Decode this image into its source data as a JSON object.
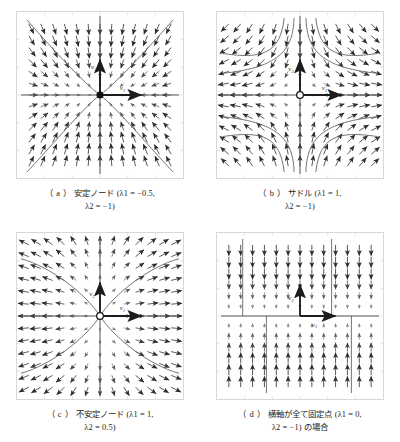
{
  "figure": {
    "background": "#ffffff",
    "frame_color": "#d8d8d8",
    "arrow_color": "#2b2b2b",
    "trajectory_color": "#4a4a4a",
    "axis_color": "#4d4d4d"
  },
  "panels": [
    {
      "id": "a",
      "tag": "（ a ）",
      "title": "安定ノード",
      "caption_line1": "安定ノード (λ1 = −0.5,",
      "caption_line2": "λ2 = −1)",
      "lambda1": "-0.5",
      "lambda2": "-1",
      "fixed_point_style": "filled",
      "flow_direction": "inward",
      "eigenvector_labels": [
        "v1",
        "v2"
      ],
      "axis_labels": {
        "horizontal": "v1",
        "vertical": "v2"
      }
    },
    {
      "id": "b",
      "tag": "（ b ）",
      "title": "サドル",
      "caption_line1": "サドル (λ1 = 1,",
      "caption_line2": "λ2 = −1)",
      "lambda1": "1",
      "lambda2": "-1",
      "fixed_point_style": "hollow",
      "flow_direction": "saddle",
      "eigenvector_labels": [
        "v1",
        "v2"
      ],
      "axis_labels": {
        "horizontal": "v1",
        "vertical": "v2"
      }
    },
    {
      "id": "c",
      "tag": "（ c ）",
      "title": "不安定ノード",
      "caption_line1": "不安定ノード (λ1 = 1,",
      "caption_line2": "λ2 = 0.5)",
      "lambda1": "1",
      "lambda2": "0.5",
      "fixed_point_style": "hollow",
      "flow_direction": "outward",
      "eigenvector_labels": [
        "v1",
        "v2"
      ],
      "axis_labels": {
        "horizontal": "v1",
        "vertical": "v2"
      }
    },
    {
      "id": "d",
      "tag": "（ d ）",
      "title": "横軸が全て固定点",
      "caption_line1": "横軸が全て固定点 (λ1 = 0,",
      "caption_line2": "λ2 = −1) の場合",
      "lambda1": "0",
      "lambda2": "-1",
      "fixed_point_style": "line",
      "flow_direction": "vertical-inward",
      "eigenvector_labels": [
        "v1",
        "v2"
      ],
      "axis_labels": {
        "horizontal": "v1",
        "vertical": "v2"
      }
    }
  ]
}
